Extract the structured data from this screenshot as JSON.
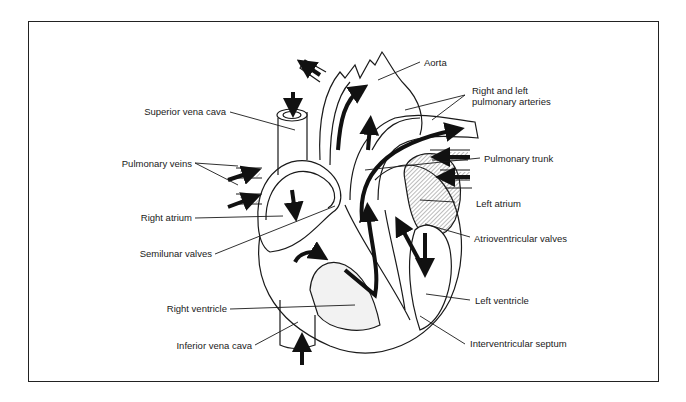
{
  "diagram": {
    "labels": {
      "superior_vena_cava": "Superior vena cava",
      "pulmonary_veins": "Pulmonary veins",
      "right_atrium": "Right atrium",
      "semilunar_valves": "Semilunar valves",
      "right_ventricle": "Right ventricle",
      "inferior_vena_cava": "Inferior vena cava",
      "aorta": "Aorta",
      "pulmonary_arteries_line1": "Right and left",
      "pulmonary_arteries_line2": "pulmonary arteries",
      "pulmonary_trunk": "Pulmonary trunk",
      "left_atrium": "Left atrium",
      "atrioventricular_valves": "Atrioventricular valves",
      "left_ventricle": "Left ventricle",
      "interventricular_septum": "Interventricular septum"
    },
    "colors": {
      "line": "#1a1a1a",
      "background": "#ffffff",
      "shading": "#e6e6e6"
    }
  }
}
